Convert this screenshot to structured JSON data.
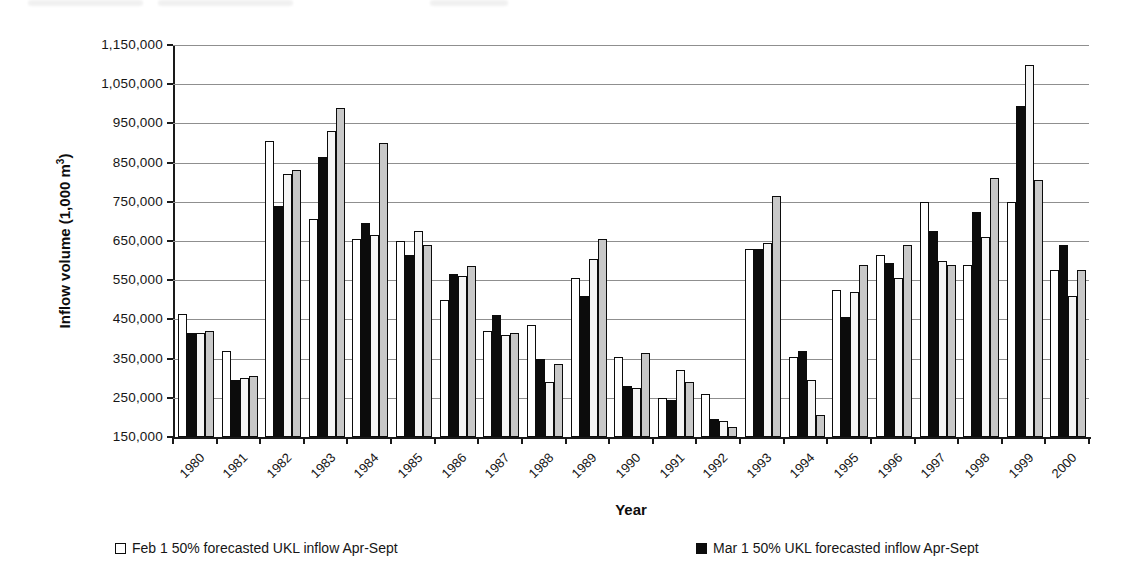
{
  "figure": {
    "y_axis_title": {
      "prefix": "Inflow volume (1,000 m",
      "sup": "3",
      "suffix": ")"
    },
    "x_axis_title": "Year",
    "legend": [
      {
        "label": "Feb 1 50% forecasted UKL inflow Apr-Sept",
        "swatch_color": "#ffffff"
      },
      {
        "label": "Mar 1 50% UKL forecasted inflow Apr-Sept",
        "swatch_color": "#0c0c0c"
      }
    ]
  },
  "chart_data": {
    "type": "bar",
    "title": "",
    "xlabel": "Year",
    "ylabel": "Inflow volume (1,000 m3)",
    "ylim": [
      150000,
      1150000
    ],
    "ytick_step": 100000,
    "ytick_labels": [
      "150,000",
      "250,000",
      "350,000",
      "450,000",
      "550,000",
      "650,000",
      "750,000",
      "850,000",
      "950,000",
      "1,050,000",
      "1,150,000"
    ],
    "grid": "horizontal",
    "legend_position": "bottom",
    "categories": [
      "1980",
      "1981",
      "1982",
      "1983",
      "1984",
      "1985",
      "1986",
      "1987",
      "1988",
      "1989",
      "1990",
      "1991",
      "1992",
      "1993",
      "1994",
      "1995",
      "1996",
      "1997",
      "1998",
      "1999",
      "2000"
    ],
    "series": [
      {
        "name": "Feb 1 50% forecasted UKL inflow Apr-Sept",
        "color": "#ffffff",
        "values": [
          465000,
          370000,
          905000,
          705000,
          655000,
          650000,
          500000,
          420000,
          435000,
          555000,
          355000,
          250000,
          260000,
          630000,
          355000,
          525000,
          615000,
          750000,
          590000,
          750000,
          575000
        ]
      },
      {
        "name": "Mar 1 50% UKL forecasted inflow Apr-Sept",
        "color": "#0c0c0c",
        "values": [
          415000,
          295000,
          740000,
          865000,
          695000,
          615000,
          565000,
          460000,
          350000,
          510000,
          280000,
          245000,
          195000,
          630000,
          370000,
          455000,
          595000,
          675000,
          725000,
          995000,
          640000
        ]
      },
      {
        "name": "unlabeled white series (legend not visible in crop)",
        "color": "#f5f5f5",
        "values": [
          415000,
          300000,
          820000,
          930000,
          665000,
          675000,
          560000,
          410000,
          290000,
          605000,
          275000,
          320000,
          190000,
          645000,
          295000,
          520000,
          555000,
          600000,
          660000,
          1100000,
          510000
        ]
      },
      {
        "name": "unlabeled gray series (legend not visible in crop)",
        "color": "#c8c8c8",
        "values": [
          420000,
          305000,
          830000,
          990000,
          900000,
          640000,
          585000,
          415000,
          335000,
          655000,
          365000,
          290000,
          175000,
          765000,
          205000,
          590000,
          640000,
          590000,
          810000,
          805000,
          575000
        ]
      }
    ]
  }
}
